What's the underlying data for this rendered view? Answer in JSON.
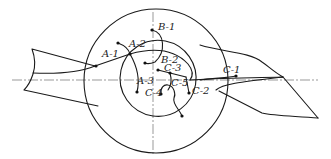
{
  "diagram": {
    "title": "",
    "colors": {
      "line": "#1a1a1a",
      "centerline": "#555555",
      "background": "#ffffff"
    },
    "labels": {
      "a1": "A-1",
      "a2": "A-2",
      "a3": "A-3",
      "b1": "B-1",
      "b2": "B-2",
      "c1": "C-1",
      "c2": "C-2",
      "c3": "C-3",
      "c4": "C-4",
      "c5": "C-5"
    },
    "shapes": {
      "outer_circle": {
        "cx": 155,
        "cy": 80,
        "r": 72
      },
      "inner_circle": {
        "cx": 155,
        "cy": 80,
        "r": 38
      }
    }
  }
}
